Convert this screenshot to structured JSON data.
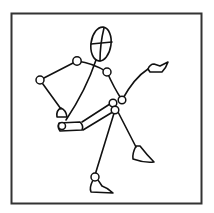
{
  "figure": {
    "title": "Posed stick figure mannequin drawing",
    "subject": "stick figure",
    "frame_color": "#333333",
    "stroke_color": "#111111",
    "background": "#ffffff"
  }
}
